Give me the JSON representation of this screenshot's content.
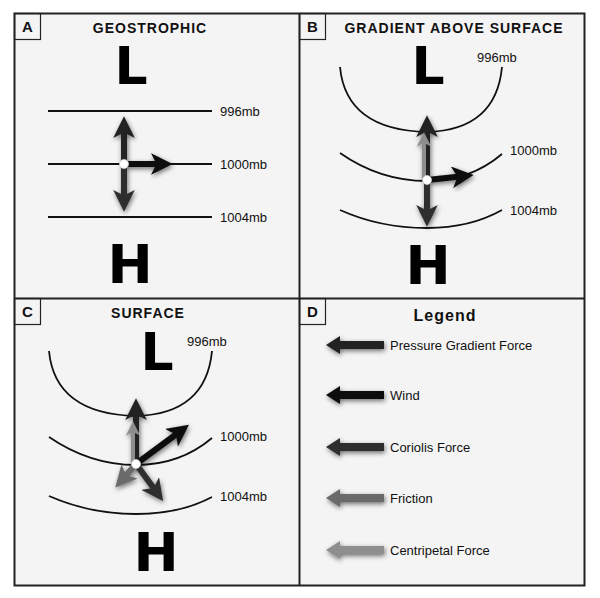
{
  "colors": {
    "background": "#f4f4f4",
    "border": "#222222",
    "isobar": "#111111",
    "pressure_gradient_force": "#222222",
    "wind": "#0d0d0d",
    "coriolis_force": "#2e2e2e",
    "friction": "#6a6a6a",
    "centripetal_force": "#8e8e8e"
  },
  "panels": [
    {
      "letter": "A",
      "title": "GEOSTROPHIC",
      "low_label": "L",
      "high_label": "H",
      "isobars": [
        "996mb",
        "1000mb",
        "1004mb"
      ]
    },
    {
      "letter": "B",
      "title": "GRADIENT ABOVE SURFACE",
      "low_label": "L",
      "high_label": "H",
      "isobars": [
        "996mb",
        "1000mb",
        "1004mb"
      ]
    },
    {
      "letter": "C",
      "title": "SURFACE",
      "low_label": "L",
      "high_label": "H",
      "isobars": [
        "996mb",
        "1000mb",
        "1004mb"
      ]
    },
    {
      "letter": "D",
      "title": "Legend"
    }
  ],
  "legend": {
    "items": [
      {
        "label": "Pressure Gradient Force",
        "icon": "arrow-left-icon",
        "color_key": "pressure_gradient_force"
      },
      {
        "label": "Wind",
        "icon": "arrow-left-icon",
        "color_key": "wind"
      },
      {
        "label": "Coriolis Force",
        "icon": "arrow-left-icon",
        "color_key": "coriolis_force"
      },
      {
        "label": "Friction",
        "icon": "arrow-left-icon",
        "color_key": "friction"
      },
      {
        "label": "Centripetal Force",
        "icon": "arrow-left-icon",
        "color_key": "centripetal_force"
      }
    ]
  }
}
